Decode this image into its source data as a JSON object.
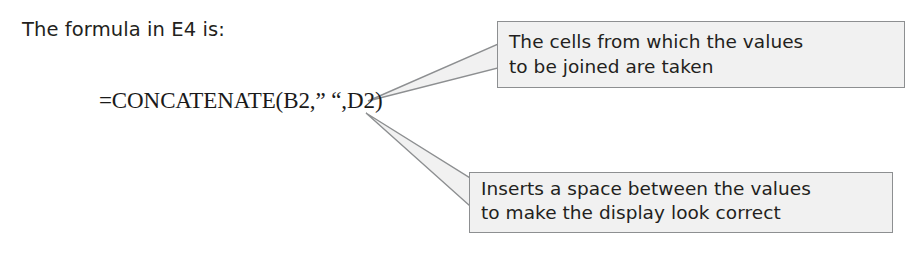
{
  "slide": {
    "background_color": "#ffffff",
    "intro_text": "The formula in E4 is:",
    "formula": "=CONCATENATE(B2,” “,D2)"
  },
  "callouts": [
    {
      "name": "cells-source-callout",
      "line1": "The cells from which the values",
      "line2": "to be joined are taken",
      "fill_color": "#f1f1f1",
      "border_color": "#8d8f91",
      "text_color": "#231f20"
    },
    {
      "name": "space-separator-callout",
      "line1": "Inserts a space between the values",
      "line2": "to make the display look correct",
      "fill_color": "#f1f1f1",
      "border_color": "#8d8f91",
      "text_color": "#231f20"
    }
  ],
  "leaders": {
    "top_pointer_name": "top-callout-pointer",
    "bottom_pointer_name": "bottom-callout-pointer",
    "stroke_color": "#8d8f91"
  }
}
